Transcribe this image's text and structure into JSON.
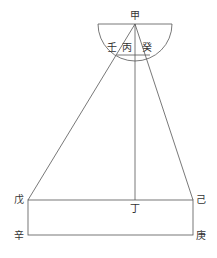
{
  "diagram": {
    "labels": {
      "top": "甲",
      "left_inner": "壬",
      "center_inner": "丙",
      "right_inner": "癸",
      "bottom_mid": "丁",
      "left_top": "戊",
      "right_top": "己",
      "left_bottom": "辛",
      "right_bottom": "庚"
    },
    "line_color": "#555555"
  }
}
